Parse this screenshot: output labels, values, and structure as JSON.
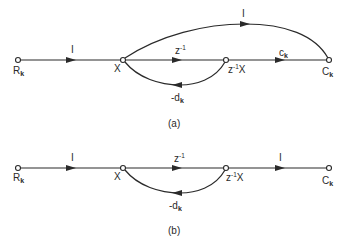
{
  "figure": {
    "diagram_a": {
      "caption": "(a)",
      "nodes": {
        "input": {
          "main": "R",
          "sub": "k"
        },
        "x": {
          "main": "X"
        },
        "delay": {
          "pre": "z",
          "sup": "-1",
          "post": "X"
        },
        "output": {
          "main": "C",
          "sub": "k"
        }
      },
      "branches": {
        "input_gain": "I",
        "delay_gain": {
          "main": "z",
          "sup": "-1"
        },
        "output_gain": {
          "main": "c",
          "sub": "k"
        },
        "feedforward_gain": "I",
        "feedback_gain": {
          "main": "-d",
          "sub": "k"
        }
      }
    },
    "diagram_b": {
      "caption": "(b)",
      "nodes": {
        "input": {
          "main": "R",
          "sub": "k"
        },
        "x": {
          "main": "X"
        },
        "delay": {
          "pre": "z",
          "sup": "-1",
          "post": "X"
        },
        "output": {
          "main": "C",
          "sub": "k"
        }
      },
      "branches": {
        "input_gain": "I",
        "delay_gain": {
          "main": "z",
          "sup": "-1"
        },
        "output_gain": "I",
        "feedback_gain": {
          "main": "-d",
          "sub": "k"
        }
      }
    }
  }
}
